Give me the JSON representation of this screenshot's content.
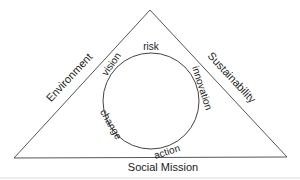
{
  "diagram": {
    "triangle": {
      "left_side_label": "Environment",
      "right_side_label": "Sustainability",
      "base_label": "Social Mission",
      "stroke_color": "#555555"
    },
    "cycle": {
      "stroke_color": "#444444",
      "labels": {
        "top": "risk",
        "upper_right": "innovation",
        "bottom": "action",
        "lower_left": "change",
        "upper_left": "vision"
      }
    }
  }
}
